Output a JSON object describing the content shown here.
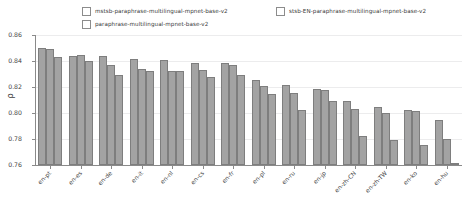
{
  "chart_data": {
    "type": "bar",
    "title": "",
    "xlabel": "",
    "ylabel": "ρ",
    "ylim": [
      0.76,
      0.86
    ],
    "yticks": [
      "0.76",
      "0.78",
      "0.80",
      "0.82",
      "0.84",
      "0.86"
    ],
    "ytick_values": [
      0.76,
      0.78,
      0.8,
      0.82,
      0.84,
      0.86
    ],
    "grid": true,
    "legend_position": "upper-center",
    "categories": [
      "en-pt",
      "en-es",
      "en-de",
      "en-it",
      "en-nl",
      "en-cs",
      "en-fr",
      "en-pl",
      "en-ru",
      "en-jp",
      "en-zh-CN",
      "en-zh-TW",
      "en-ko",
      "en-hu"
    ],
    "series": [
      {
        "name": "mstsb-paraphrase-multilingual-mpnet-base-v2",
        "color": "#a3a3a3",
        "values": [
          0.85,
          0.8437,
          0.8437,
          0.8415,
          0.8408,
          0.8387,
          0.8385,
          0.8257,
          0.8219,
          0.8188,
          0.8092,
          0.8046,
          0.8022,
          0.7948
        ]
      },
      {
        "name": "paraphrase-multilingual-mpnet-base-v2",
        "color": "#a3a3a3",
        "values": [
          0.8496,
          0.8443,
          0.837,
          0.8339,
          0.8327,
          0.833,
          0.8368,
          0.8208,
          0.8157,
          0.8178,
          0.8031,
          0.8002,
          0.8018,
          0.7801
        ]
      },
      {
        "name": "stsb-EN-paraphrase-multilingual-mpnet-base-v2",
        "color": "#a3a3a3",
        "values": [
          0.8432,
          0.8399,
          0.8293,
          0.8323,
          0.8321,
          0.8274,
          0.8293,
          0.8148,
          0.8024,
          0.809,
          0.7825,
          0.779,
          0.7755,
          0.7605
        ]
      }
    ]
  },
  "legend": {
    "entries": [
      {
        "label": "mstsb-paraphrase-multilingual-mpnet-base-v2"
      },
      {
        "label": "paraphrase-multilingual-mpnet-base-v2"
      },
      {
        "label": "stsb-EN-paraphrase-multilingual-mpnet-base-v2"
      }
    ]
  }
}
